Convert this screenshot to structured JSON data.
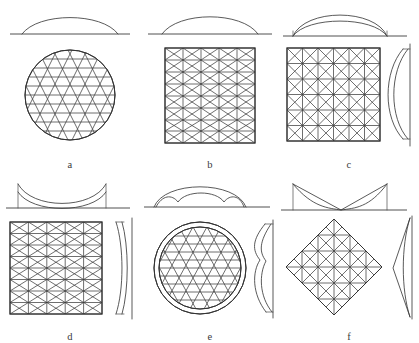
{
  "figure": {
    "background_color": "#ffffff",
    "line_color": "#3c3c3c",
    "panel_count": 6
  },
  "panels": [
    {
      "id": "a",
      "label": "a",
      "plan_shape": "circle",
      "mesh_type": "triangular",
      "elevation": "single shallow dome arc",
      "has_side_view": false,
      "rows": 9,
      "description": "Circular plan with triangular mesh, shallow spherical dome profile"
    },
    {
      "id": "b",
      "label": "b",
      "plan_shape": "rectangle",
      "mesh_type": "triangular",
      "elevation": "single shallow dome arc",
      "has_side_view": false,
      "rows": 8,
      "cols": 5,
      "description": "Rectangular plan with triangular mesh, shallow barrel arc profile"
    },
    {
      "id": "c",
      "label": "c",
      "plan_shape": "square",
      "mesh_type": "square with double diagonals",
      "elevation": "double arc shell (convex)",
      "has_side_view": true,
      "side_view": "convex bulge",
      "rows": 6,
      "cols": 6,
      "description": "Square plan with X-braced square grid, doubly curved convex shell"
    },
    {
      "id": "d",
      "label": "d",
      "plan_shape": "square",
      "mesh_type": "triangular",
      "elevation": "double concave sagging arc",
      "has_side_view": true,
      "side_view": "concave curve",
      "rows": 8,
      "cols": 5,
      "description": "Square plan with triangular mesh, sagging concave shell"
    },
    {
      "id": "e",
      "label": "e",
      "plan_shape": "circle with double rim",
      "mesh_type": "triangular",
      "elevation": "large arc with inner lobed arc",
      "has_side_view": true,
      "side_view": "lobed convex curve",
      "rows": 9,
      "description": "Circular plan with double boundary ring and triangular mesh, multi-lobed dome"
    },
    {
      "id": "f",
      "label": "f",
      "plan_shape": "diamond (rotated square)",
      "mesh_type": "square with diagonals",
      "elevation": "hyperbolic V / saddle profile",
      "has_side_view": true,
      "side_view": "pointed saddle wedge",
      "rows": 6,
      "cols": 6,
      "description": "Diamond plan with braced grid, hyperbolic paraboloid saddle profile"
    }
  ]
}
